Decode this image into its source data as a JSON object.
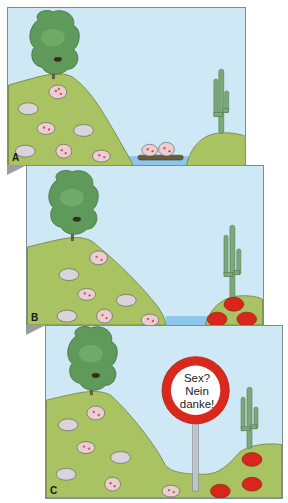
{
  "figure": {
    "colors": {
      "sky": "#cfe8f6",
      "hill": "#a9c262",
      "hill_outline": "#6f7f3a",
      "water": "#8cc6ea",
      "tree": "#5f9a5a",
      "cactus": "#7da97a",
      "mouse_gray": "#d9d4dc",
      "mouse_spotted_spots": "#d9534f",
      "mouse_red": "#d8261a",
      "sign_ring": "#d8291c",
      "sign_pole": "#bfc4c8",
      "panel_border": "#7f8b95",
      "fold_shadow": "#9a9ea2"
    },
    "panels": [
      {
        "label": "A",
        "scene": "Mice on large hill with tree; two spotted mice crossing water on a log raft toward a small hill with a cactus"
      },
      {
        "label": "B",
        "scene": "Mainland population of gray and spotted mice; island population near cactus has become red"
      },
      {
        "label": "C",
        "scene": "Land bridge reconnects; a sign between populations reads 'Sex? Nein danke!' indicating reproductive isolation"
      }
    ],
    "sign": {
      "line1": "Sex?",
      "line2": "Nein",
      "line3": "danke!"
    }
  }
}
